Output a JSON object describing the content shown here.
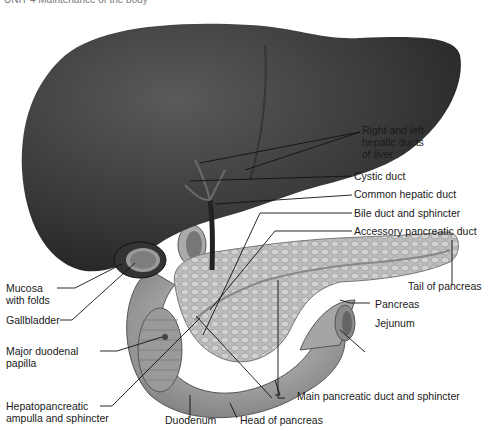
{
  "figure": {
    "caption_fragment": "UNIT 4  Maintenance of the body",
    "colors": {
      "organ_dark": "#3a3a3a",
      "organ_mid": "#8a8a8a",
      "pancreas": "#b8b8b8",
      "leader_line": "#111111",
      "background": "#ffffff"
    }
  },
  "labels_right": [
    {
      "text": "Right and left",
      "line2": "hepatic ducts",
      "line3": "of liver"
    },
    {
      "text": "Cystic duct"
    },
    {
      "text": "Common hepatic duct"
    },
    {
      "text": "Bile duct and sphincter"
    },
    {
      "text": "Accessory pancreatic duct"
    },
    {
      "text": "Tail of pancreas"
    },
    {
      "text": "Pancreas"
    },
    {
      "text": "Jejunum"
    },
    {
      "text": "Main pancreatic duct and sphincter"
    }
  ],
  "labels_left": [
    {
      "text": "Mucosa",
      "line2": "with folds"
    },
    {
      "text": "Gallbladder"
    },
    {
      "text": "Major duodenal",
      "line2": "papilla"
    },
    {
      "text": "Hepatopancreatic",
      "line2": "ampulla and sphincter"
    }
  ],
  "labels_bottom": [
    {
      "text": "Duodenum"
    },
    {
      "text": "Head of pancreas"
    }
  ]
}
